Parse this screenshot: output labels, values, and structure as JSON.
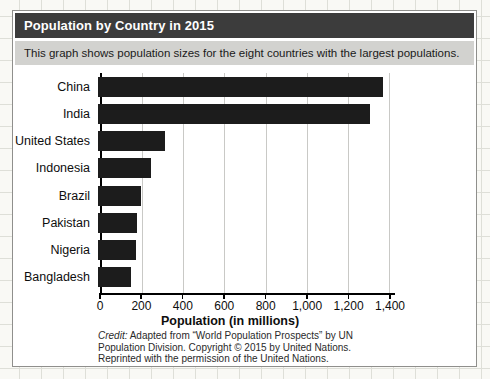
{
  "header": {
    "title": "Population by Country in 2015"
  },
  "subtitle": "This graph shows population sizes for the eight countries with the largest populations.",
  "chart_data": {
    "type": "bar",
    "orientation": "horizontal",
    "categories": [
      "China",
      "India",
      "United States",
      "Indonesia",
      "Brazil",
      "Pakistan",
      "Nigeria",
      "Bangladesh"
    ],
    "values": [
      1376,
      1311,
      322,
      258,
      208,
      189,
      182,
      161
    ],
    "title": "Population by Country in 2015",
    "xlabel": "Population (in millions)",
    "ylabel": "",
    "xlim": [
      0,
      1400
    ],
    "xticks": [
      0,
      200,
      400,
      600,
      800,
      1000,
      1200,
      1400
    ],
    "xtick_labels": [
      "0",
      "200",
      "400",
      "600",
      "800",
      "1,000",
      "1,200",
      "1,400"
    ],
    "grid": "vertical-gridlines-on",
    "legend": "none",
    "bar_color": "#1c1c1c"
  },
  "credit": {
    "label": "Credit:",
    "line1_rest": " Adapted from “World Population Prospects” by UN",
    "line2": "Population Division. Copyright © 2015 by United Nations.",
    "line3": "Reprinted with the permission of the United Nations."
  },
  "colors": {
    "title_bar_bg": "#3c3c3c",
    "title_text": "#ffffff",
    "subtitle_bg": "#d2d2cf",
    "bar": "#1c1c1c",
    "axis": "#000000",
    "gridline": "#c9c9c6",
    "paper_grid": "#dedfd8"
  }
}
